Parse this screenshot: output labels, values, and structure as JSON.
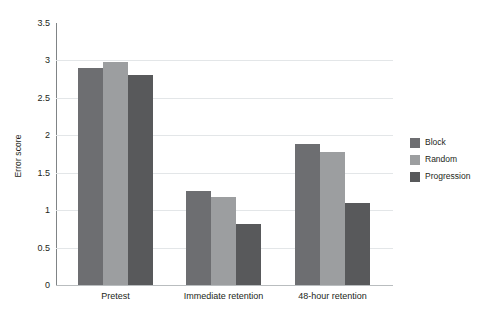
{
  "chart_data": {
    "type": "bar",
    "title": "",
    "subtitle": "",
    "xlabel": "",
    "ylabel": "Error score",
    "categories": [
      "Pretest",
      "Immediate retention",
      "48-hour retention"
    ],
    "series": [
      {
        "name": "Block",
        "color": "#6d6e71",
        "values": [
          2.9,
          1.25,
          1.88
        ]
      },
      {
        "name": "Random",
        "color": "#9c9e a0",
        "values": [
          2.98,
          1.17,
          1.78
        ]
      },
      {
        "name": "Progression",
        "color": "#58595b",
        "values": [
          2.8,
          0.82,
          1.1
        ]
      }
    ],
    "ylim": [
      0,
      3.5
    ],
    "yticks": [
      0,
      0.5,
      1,
      1.5,
      2,
      2.5,
      3,
      3.5
    ],
    "ytick_labels": [
      "0",
      "0.5",
      "1",
      "1.5",
      "2",
      "2.5",
      "3",
      "3.5"
    ],
    "grid": true,
    "grid_axis": "y",
    "legend_position": "right",
    "legend_entries": [
      "Block",
      "Random",
      "Progression"
    ],
    "background_color": "#ffffff",
    "gridline_color": "#e3e6e8",
    "axis_color": "#808486",
    "text_color": "#231f20"
  }
}
